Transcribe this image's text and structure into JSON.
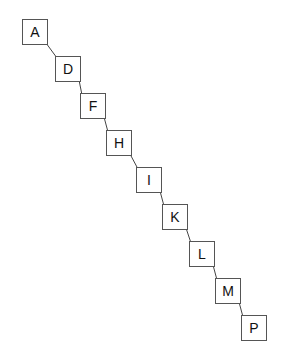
{
  "diagram": {
    "type": "chain",
    "nodes": [
      {
        "id": "A",
        "label": "A",
        "x": 22,
        "y": 19
      },
      {
        "id": "D",
        "label": "D",
        "x": 55,
        "y": 56
      },
      {
        "id": "F",
        "label": "F",
        "x": 80,
        "y": 93
      },
      {
        "id": "H",
        "label": "H",
        "x": 106,
        "y": 130
      },
      {
        "id": "I",
        "label": "I",
        "x": 136,
        "y": 167
      },
      {
        "id": "K",
        "label": "K",
        "x": 162,
        "y": 204
      },
      {
        "id": "L",
        "label": "L",
        "x": 189,
        "y": 241
      },
      {
        "id": "M",
        "label": "M",
        "x": 215,
        "y": 278
      },
      {
        "id": "P",
        "label": "P",
        "x": 241,
        "y": 315
      }
    ],
    "edges": [
      [
        "A",
        "D"
      ],
      [
        "D",
        "F"
      ],
      [
        "F",
        "H"
      ],
      [
        "H",
        "I"
      ],
      [
        "I",
        "K"
      ],
      [
        "K",
        "L"
      ],
      [
        "L",
        "M"
      ],
      [
        "M",
        "P"
      ]
    ],
    "colors": {
      "border": "#555555",
      "edge": "#444444",
      "text": "#111111"
    }
  }
}
